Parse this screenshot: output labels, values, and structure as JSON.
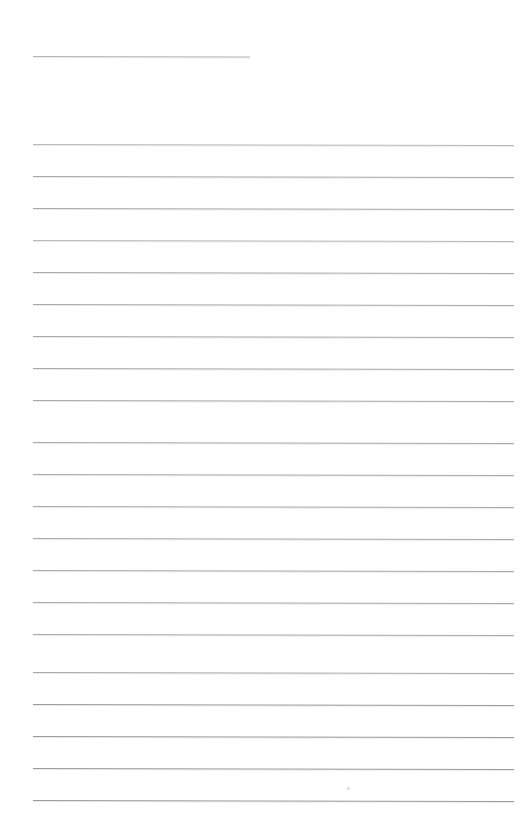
{
  "document": {
    "kind": "scanned-lined-paper",
    "title": "Blank ruled notebook page",
    "page_width": 521,
    "page_height": 825,
    "background_color": "#ffffff",
    "rule_color": "#a9a9ad",
    "has_text": false,
    "text_content": ""
  },
  "rules": {
    "count": 22,
    "spacing_px": 32,
    "left_margin_px": 33,
    "right_edge_px": 514,
    "skew_deg": 0.115,
    "items": [
      {
        "name": "rule-top-short",
        "y": 56,
        "x": 33,
        "width": 217,
        "tone": "short"
      },
      {
        "name": "rule-01",
        "y": 144,
        "x": 33,
        "width": 481,
        "tone": "faint"
      },
      {
        "name": "rule-02",
        "y": 176,
        "x": 33,
        "width": 481,
        "tone": "normal"
      },
      {
        "name": "rule-03",
        "y": 208,
        "x": 33,
        "width": 481,
        "tone": "normal"
      },
      {
        "name": "rule-04",
        "y": 240,
        "x": 33,
        "width": 481,
        "tone": "faint"
      },
      {
        "name": "rule-05",
        "y": 272,
        "x": 33,
        "width": 481,
        "tone": "normal"
      },
      {
        "name": "rule-06",
        "y": 304,
        "x": 33,
        "width": 481,
        "tone": "normal"
      },
      {
        "name": "rule-07",
        "y": 336,
        "x": 33,
        "width": 481,
        "tone": "normal"
      },
      {
        "name": "rule-08",
        "y": 368,
        "x": 33,
        "width": 481,
        "tone": "normal"
      },
      {
        "name": "rule-09",
        "y": 400,
        "x": 33,
        "width": 481,
        "tone": "normal"
      },
      {
        "name": "rule-10",
        "y": 442,
        "x": 33,
        "width": 481,
        "tone": "normal"
      },
      {
        "name": "rule-11",
        "y": 474,
        "x": 33,
        "width": 481,
        "tone": "normal"
      },
      {
        "name": "rule-12",
        "y": 506,
        "x": 33,
        "width": 481,
        "tone": "normal"
      },
      {
        "name": "rule-13",
        "y": 538,
        "x": 33,
        "width": 481,
        "tone": "normal"
      },
      {
        "name": "rule-14",
        "y": 570,
        "x": 33,
        "width": 481,
        "tone": "normal"
      },
      {
        "name": "rule-15",
        "y": 602,
        "x": 33,
        "width": 481,
        "tone": "normal"
      },
      {
        "name": "rule-16",
        "y": 634,
        "x": 33,
        "width": 481,
        "tone": "normal"
      },
      {
        "name": "rule-17",
        "y": 672,
        "x": 33,
        "width": 481,
        "tone": "normal"
      },
      {
        "name": "rule-18",
        "y": 704,
        "x": 33,
        "width": 481,
        "tone": "dark"
      },
      {
        "name": "rule-19",
        "y": 736,
        "x": 33,
        "width": 481,
        "tone": "dark"
      },
      {
        "name": "rule-20",
        "y": 768,
        "x": 33,
        "width": 481,
        "tone": "dark"
      },
      {
        "name": "rule-21",
        "y": 800,
        "x": 33,
        "width": 481,
        "tone": "dark"
      }
    ]
  },
  "artifacts": {
    "items": [
      {
        "name": "scan-speck",
        "x": 347,
        "y": 787,
        "size": 3
      }
    ]
  }
}
